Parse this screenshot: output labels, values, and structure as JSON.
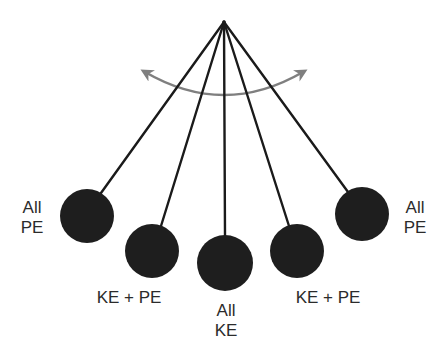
{
  "diagram": {
    "pivot": {
      "x": 224,
      "y": 22
    },
    "string_color": "#1a1a1a",
    "bob_color": "#1e1e1e",
    "bob_radius": 27,
    "arrow_color": "#7f7f7f",
    "bobs": [
      {
        "x": 87,
        "y": 216,
        "label_lines": [
          "All",
          "PE"
        ]
      },
      {
        "x": 152,
        "y": 251,
        "label_lines": [
          "KE + PE"
        ]
      },
      {
        "x": 225,
        "y": 263,
        "label_lines": [
          "All",
          "KE"
        ]
      },
      {
        "x": 297,
        "y": 251,
        "label_lines": [
          "KE + PE"
        ]
      },
      {
        "x": 362,
        "y": 214,
        "label_lines": [
          "All",
          "PE"
        ]
      }
    ],
    "labels": {
      "left_extreme": {
        "line1": "All",
        "line2": "PE"
      },
      "left_middle": {
        "text": "KE + PE"
      },
      "bottom": {
        "line1": "All",
        "line2": "KE"
      },
      "right_middle": {
        "text": "KE + PE"
      },
      "right_extreme": {
        "line1": "All",
        "line2": "PE"
      }
    },
    "swing_arrow": {
      "description": "double-headed curved arrow indicating swing motion"
    }
  }
}
